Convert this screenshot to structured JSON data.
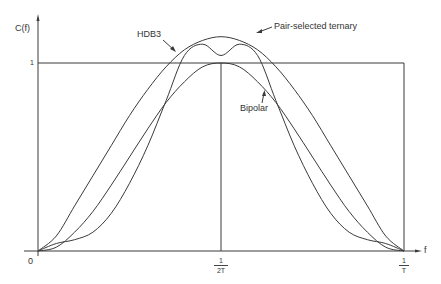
{
  "chart_data": {
    "type": "line",
    "title": "",
    "xlabel": "f",
    "ylabel": "C(f)",
    "x_ticks": [
      {
        "value": 0,
        "label": "0"
      },
      {
        "value": 0.5,
        "label_num": "1",
        "label_den": "2T"
      },
      {
        "value": 1,
        "label_num": "1",
        "label_den": "T"
      }
    ],
    "y_ticks": [
      {
        "value": 1,
        "label": "1"
      }
    ],
    "xlim": [
      0,
      1
    ],
    "ylim": [
      0,
      1.22
    ],
    "grid": false,
    "legend": "inline annotations",
    "x": [
      0,
      0.05,
      0.1,
      0.15,
      0.2,
      0.25,
      0.3,
      0.35,
      0.4,
      0.45,
      0.5,
      0.55,
      0.6,
      0.65,
      0.7,
      0.75,
      0.8,
      0.85,
      0.9,
      0.95,
      1.0
    ],
    "series": [
      {
        "name": "Pair-selected ternary",
        "values": [
          0,
          0.08,
          0.24,
          0.4,
          0.56,
          0.72,
          0.86,
          0.98,
          1.07,
          1.12,
          1.14,
          1.12,
          1.07,
          0.98,
          0.86,
          0.72,
          0.56,
          0.4,
          0.24,
          0.08,
          0
        ]
      },
      {
        "name": "HDB3",
        "values": [
          0,
          0.04,
          0.06,
          0.1,
          0.2,
          0.36,
          0.56,
          0.8,
          1.04,
          1.1,
          1.04,
          1.1,
          1.04,
          0.8,
          0.56,
          0.36,
          0.2,
          0.1,
          0.06,
          0.04,
          0
        ]
      },
      {
        "name": "Bipolar",
        "values": [
          0,
          0.02,
          0.1,
          0.21,
          0.35,
          0.5,
          0.65,
          0.79,
          0.9,
          0.98,
          1.0,
          0.98,
          0.9,
          0.79,
          0.65,
          0.5,
          0.35,
          0.21,
          0.1,
          0.02,
          0
        ]
      }
    ],
    "reference_lines": [
      {
        "type": "horizontal",
        "y": 1,
        "from_x": 0,
        "to_x": 1
      },
      {
        "type": "vertical",
        "x": 0.5,
        "from_y": 0,
        "to_y": 1
      },
      {
        "type": "vertical",
        "x": 1,
        "from_y": 0,
        "to_y": 1
      }
    ],
    "annotations": [
      {
        "text": "Pair-selected ternary",
        "series": "Pair-selected ternary"
      },
      {
        "text": "HDB3",
        "series": "HDB3"
      },
      {
        "text": "Bipolar",
        "series": "Bipolar"
      }
    ]
  },
  "labels": {
    "y_axis": "C(f)",
    "x_axis": "f",
    "origin": "0",
    "one": "1",
    "half_num": "1",
    "half_den": "2T",
    "end_num": "1",
    "end_den": "T",
    "pair_selected": "Pair-selected ternary",
    "hdb3": "HDB3",
    "bipolar": "Bipolar"
  },
  "colors": {
    "line": "#3a3a3a",
    "text": "#333333",
    "background": "#ffffff"
  }
}
